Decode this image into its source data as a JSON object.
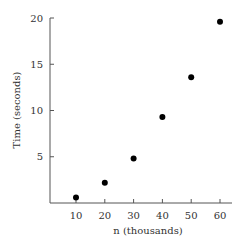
{
  "chart_data": {
    "type": "scatter",
    "title": "",
    "xlabel": "n (thousands)",
    "ylabel": "Time (seconds)",
    "x": [
      10,
      20,
      30,
      40,
      50,
      60
    ],
    "y": [
      0.6,
      2.2,
      4.8,
      9.3,
      13.6,
      19.6
    ],
    "xticks": [
      10,
      20,
      30,
      40,
      50,
      60
    ],
    "yticks": [
      5,
      10,
      15,
      20
    ],
    "xlim": [
      1,
      65
    ],
    "ylim": [
      0,
      20
    ],
    "grid": false,
    "legend": null,
    "marker_color": "#000000"
  }
}
